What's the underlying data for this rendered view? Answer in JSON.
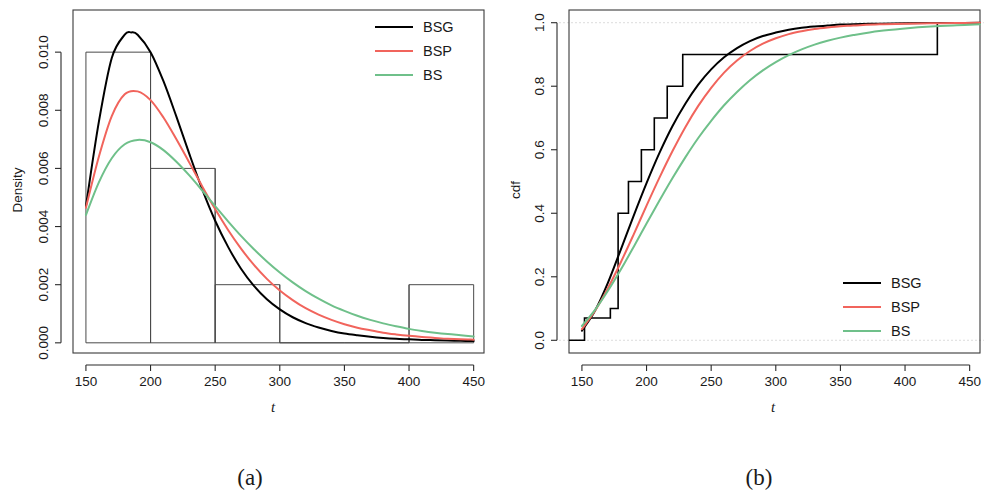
{
  "figure": {
    "panels": [
      {
        "id": "a",
        "subcaption": "(a)"
      },
      {
        "id": "b",
        "subcaption": "(b)"
      }
    ]
  },
  "colors": {
    "BSG": "#000000",
    "BSP": "#F1645C",
    "BS": "#6FC08A",
    "axis": "#2a2a2a",
    "frame": "#3a3a3a",
    "histogram": "#4a4a4a",
    "grid": "#d8d8d8"
  },
  "chart_data": [
    {
      "type": "line",
      "panel": "a",
      "subcaption": "(a)",
      "title": "",
      "xlabel": "t",
      "ylabel": "Density",
      "xlim": [
        140,
        458
      ],
      "ylim": [
        -0.00035,
        0.01145
      ],
      "xticks": [
        150,
        200,
        250,
        300,
        350,
        400,
        450
      ],
      "xticklabels": [
        "150",
        "200",
        "250",
        "300",
        "350",
        "400",
        "450"
      ],
      "yticks": [
        0.0,
        0.002,
        0.004,
        0.006,
        0.008,
        0.01
      ],
      "yticklabels": [
        "0.000",
        "0.002",
        "0.004",
        "0.006",
        "0.008",
        "0.010"
      ],
      "grid": false,
      "legend_position": "top-right",
      "histogram": {
        "bin_edges": [
          150,
          200,
          250,
          300,
          350,
          400,
          450
        ],
        "densities": [
          0.01,
          0.006,
          0.002,
          0.0,
          0.0,
          0.002
        ]
      },
      "series": [
        {
          "name": "BSG",
          "color": "#000000",
          "x": [
            150,
            160,
            170,
            180,
            185,
            190,
            200,
            210,
            220,
            230,
            240,
            250,
            260,
            270,
            280,
            290,
            300,
            310,
            320,
            330,
            340,
            350,
            360,
            370,
            380,
            390,
            400,
            410,
            420,
            430,
            440,
            450
          ],
          "y": [
            0.0047,
            0.0076,
            0.0098,
            0.0106,
            0.01068,
            0.0106,
            0.01,
            0.009,
            0.00778,
            0.0065,
            0.00528,
            0.0042,
            0.0033,
            0.00255,
            0.00196,
            0.0015,
            0.00115,
            0.00088,
            0.00068,
            0.00053,
            0.00041,
            0.00032,
            0.00026,
            0.00021,
            0.00017,
            0.00014,
            0.00012,
            0.0001,
            9e-05,
            8e-05,
            7e-05,
            6e-05
          ]
        },
        {
          "name": "BSP",
          "color": "#F1645C",
          "x": [
            150,
            160,
            170,
            180,
            190,
            200,
            210,
            220,
            230,
            240,
            250,
            260,
            270,
            280,
            290,
            300,
            310,
            320,
            330,
            340,
            350,
            360,
            370,
            380,
            390,
            400,
            410,
            420,
            430,
            440,
            450
          ],
          "y": [
            0.00465,
            0.0064,
            0.0078,
            0.00855,
            0.00865,
            0.00835,
            0.00775,
            0.007,
            0.0062,
            0.00538,
            0.0046,
            0.00388,
            0.00324,
            0.00268,
            0.0022,
            0.0018,
            0.00147,
            0.00119,
            0.00097,
            0.00079,
            0.00064,
            0.00052,
            0.00043,
            0.00035,
            0.00029,
            0.00024,
            0.0002,
            0.00017,
            0.00014,
            0.00012,
            0.00011
          ]
        },
        {
          "name": "BS",
          "color": "#6FC08A",
          "x": [
            150,
            160,
            170,
            180,
            190,
            200,
            210,
            220,
            230,
            240,
            250,
            260,
            270,
            280,
            290,
            300,
            310,
            320,
            330,
            340,
            350,
            360,
            370,
            380,
            390,
            400,
            410,
            420,
            430,
            440,
            450
          ],
          "y": [
            0.0044,
            0.00552,
            0.00635,
            0.00683,
            0.00698,
            0.0069,
            0.00663,
            0.00623,
            0.00576,
            0.00524,
            0.0047,
            0.00418,
            0.00368,
            0.00322,
            0.0028,
            0.00242,
            0.00208,
            0.00178,
            0.00152,
            0.00129,
            0.0011,
            0.00093,
            0.00079,
            0.00067,
            0.00057,
            0.00048,
            0.00041,
            0.00035,
            0.0003,
            0.00026,
            0.00022
          ]
        }
      ]
    },
    {
      "type": "line",
      "panel": "b",
      "subcaption": "(b)",
      "title": "",
      "xlabel": "t",
      "ylabel": "cdf",
      "xlim": [
        140,
        458
      ],
      "ylim": [
        -0.04,
        1.04
      ],
      "xticks": [
        150,
        200,
        250,
        300,
        350,
        400,
        450
      ],
      "xticklabels": [
        "150",
        "200",
        "250",
        "300",
        "350",
        "400",
        "450"
      ],
      "yticks": [
        0.0,
        0.2,
        0.4,
        0.6,
        0.8,
        1.0
      ],
      "yticklabels": [
        "0.0",
        "0.2",
        "0.4",
        "0.6",
        "0.8",
        "1.0"
      ],
      "grid": true,
      "gridlines_y": [
        0.0,
        1.0
      ],
      "legend_position": "bottom-right",
      "empirical_step": {
        "name": "BSG",
        "color": "#000000",
        "x": [
          140,
          152,
          152,
          172,
          172,
          178,
          178,
          186,
          186,
          196,
          196,
          206,
          206,
          216,
          216,
          228,
          228,
          245,
          245,
          425,
          425,
          458
        ],
        "y": [
          0.0,
          0.0,
          0.07,
          0.07,
          0.1,
          0.1,
          0.4,
          0.4,
          0.5,
          0.5,
          0.6,
          0.6,
          0.7,
          0.7,
          0.8,
          0.8,
          0.9,
          0.9,
          0.9,
          0.9,
          1.0,
          1.0
        ]
      },
      "series": [
        {
          "name": "BSG",
          "color": "#000000",
          "x": [
            150,
            160,
            170,
            180,
            190,
            200,
            210,
            220,
            230,
            240,
            250,
            260,
            270,
            280,
            290,
            300,
            310,
            320,
            330,
            340,
            350,
            360,
            380,
            400,
            420,
            440,
            458
          ],
          "y": [
            0.03,
            0.092,
            0.18,
            0.285,
            0.392,
            0.495,
            0.59,
            0.674,
            0.745,
            0.805,
            0.853,
            0.891,
            0.92,
            0.942,
            0.958,
            0.969,
            0.978,
            0.984,
            0.988,
            0.991,
            0.994,
            0.995,
            0.997,
            0.998,
            0.999,
            0.999,
            1.0
          ]
        },
        {
          "name": "BSP",
          "color": "#F1645C",
          "x": [
            150,
            160,
            170,
            180,
            190,
            200,
            210,
            220,
            230,
            240,
            250,
            260,
            270,
            280,
            290,
            300,
            310,
            320,
            330,
            340,
            350,
            360,
            380,
            400,
            420,
            440,
            458
          ],
          "y": [
            0.035,
            0.092,
            0.163,
            0.245,
            0.333,
            0.424,
            0.512,
            0.595,
            0.671,
            0.738,
            0.795,
            0.843,
            0.881,
            0.911,
            0.934,
            0.951,
            0.964,
            0.973,
            0.98,
            0.985,
            0.989,
            0.991,
            0.995,
            0.997,
            0.998,
            0.999,
            1.0
          ]
        },
        {
          "name": "BS",
          "color": "#6FC08A",
          "x": [
            150,
            160,
            170,
            180,
            190,
            200,
            210,
            220,
            230,
            240,
            250,
            260,
            270,
            280,
            290,
            300,
            310,
            320,
            330,
            340,
            350,
            360,
            380,
            400,
            420,
            440,
            458
          ],
          "y": [
            0.045,
            0.095,
            0.155,
            0.222,
            0.294,
            0.368,
            0.44,
            0.51,
            0.576,
            0.637,
            0.691,
            0.74,
            0.782,
            0.819,
            0.85,
            0.876,
            0.898,
            0.916,
            0.931,
            0.943,
            0.953,
            0.961,
            0.974,
            0.982,
            0.988,
            0.992,
            0.995
          ]
        }
      ]
    }
  ],
  "legends": [
    {
      "panel": "a",
      "entries": [
        {
          "label": "BSG",
          "color": "#000000"
        },
        {
          "label": "BSP",
          "color": "#F1645C"
        },
        {
          "label": "BS",
          "color": "#6FC08A"
        }
      ]
    },
    {
      "panel": "b",
      "entries": [
        {
          "label": "BSG",
          "color": "#000000"
        },
        {
          "label": "BSP",
          "color": "#F1645C"
        },
        {
          "label": "BS",
          "color": "#6FC08A"
        }
      ]
    }
  ]
}
